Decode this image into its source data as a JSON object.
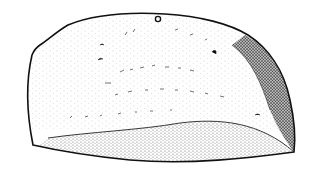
{
  "figure": {
    "colors": {
      "background": "#ffffff",
      "ink": "#111111",
      "stipple": "#444444"
    }
  }
}
